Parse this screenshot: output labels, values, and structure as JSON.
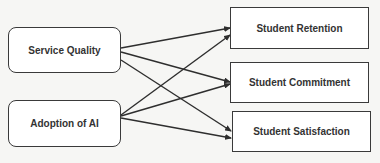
{
  "diagram": {
    "type": "conceptual-framework",
    "colors": {
      "background": "#f6f6f4",
      "box_fill": "#ffffff",
      "stroke": "#3a3a3a",
      "text": "#333333"
    },
    "independent_variables": [
      {
        "id": "sq",
        "label": "Service Quality",
        "x": 8,
        "y": 27,
        "w": 113,
        "h": 46
      },
      {
        "id": "ai",
        "label": "Adoption of AI",
        "x": 8,
        "y": 100,
        "w": 113,
        "h": 47
      }
    ],
    "dependent_variables": [
      {
        "id": "ret",
        "label": "Student Retention",
        "x": 230,
        "y": 7,
        "w": 139,
        "h": 42
      },
      {
        "id": "com",
        "label": "Student Commitment",
        "x": 230,
        "y": 62,
        "w": 139,
        "h": 41
      },
      {
        "id": "sat",
        "label": "Student Satisfaction",
        "x": 232,
        "y": 111,
        "w": 139,
        "h": 41
      }
    ],
    "edges": [
      {
        "from": "sq",
        "to": "ret",
        "x1": 121,
        "y1": 48,
        "x2": 230,
        "y2": 28
      },
      {
        "from": "sq",
        "to": "com",
        "x1": 121,
        "y1": 52,
        "x2": 230,
        "y2": 82
      },
      {
        "from": "sq",
        "to": "sat",
        "x1": 121,
        "y1": 60,
        "x2": 231,
        "y2": 131
      },
      {
        "from": "ai",
        "to": "ret",
        "x1": 121,
        "y1": 115,
        "x2": 230,
        "y2": 35
      },
      {
        "from": "ai",
        "to": "com",
        "x1": 121,
        "y1": 116,
        "x2": 230,
        "y2": 84
      },
      {
        "from": "ai",
        "to": "sat",
        "x1": 121,
        "y1": 118,
        "x2": 231,
        "y2": 138
      }
    ]
  }
}
